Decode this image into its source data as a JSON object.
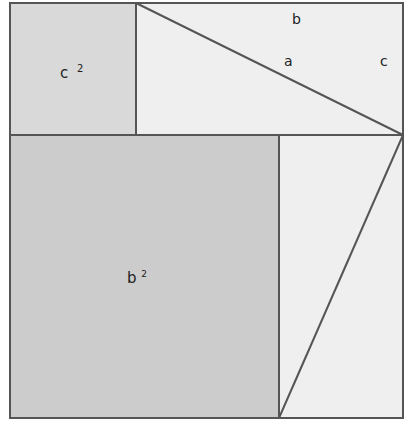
{
  "diagram": {
    "labels": {
      "c_squared": {
        "base": "c",
        "sup": "2"
      },
      "b_squared": {
        "base": "b",
        "sup": "2"
      },
      "side_b": "b",
      "side_a": "a",
      "side_c": "c"
    },
    "colors": {
      "outline": "#555555",
      "c_square_fill": "#d9d9d9",
      "b_square_fill": "#cccccc",
      "triangle_fill": "#efefef"
    }
  }
}
